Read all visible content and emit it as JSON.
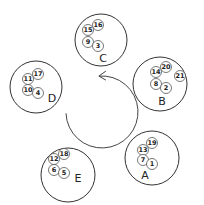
{
  "diagram": {
    "arrow": {
      "cx": 102,
      "cy": 112,
      "r": 36,
      "direction": "counterclockwise"
    },
    "groups": [
      {
        "label": "C",
        "cx": 101,
        "cy": 40,
        "r": 26,
        "lx": 103,
        "ly": 58,
        "items": [
          {
            "n": "16",
            "x": 98,
            "y": 25
          },
          {
            "n": "15",
            "x": 88,
            "y": 30
          },
          {
            "n": "9",
            "x": 88,
            "y": 42
          },
          {
            "n": "3",
            "x": 98,
            "y": 46
          }
        ]
      },
      {
        "label": "B",
        "cx": 160,
        "cy": 84,
        "r": 27,
        "lx": 162,
        "ly": 101,
        "items": [
          {
            "n": "20",
            "x": 166,
            "y": 67
          },
          {
            "n": "14",
            "x": 156,
            "y": 72
          },
          {
            "n": "21",
            "x": 180,
            "y": 76
          },
          {
            "n": "8",
            "x": 156,
            "y": 84
          },
          {
            "n": "2",
            "x": 166,
            "y": 88
          }
        ]
      },
      {
        "label": "D",
        "cx": 36,
        "cy": 87,
        "r": 26,
        "lx": 52,
        "ly": 98,
        "items": [
          {
            "n": "17",
            "x": 38,
            "y": 74
          },
          {
            "n": "11",
            "x": 28,
            "y": 79
          },
          {
            "n": "10",
            "x": 28,
            "y": 90
          },
          {
            "n": "4",
            "x": 38,
            "y": 93
          }
        ]
      },
      {
        "label": "E",
        "cx": 68,
        "cy": 175,
        "r": 27,
        "lx": 78,
        "ly": 178,
        "items": [
          {
            "n": "18",
            "x": 64,
            "y": 154
          },
          {
            "n": "12",
            "x": 54,
            "y": 159
          },
          {
            "n": "6",
            "x": 54,
            "y": 170
          },
          {
            "n": "5",
            "x": 64,
            "y": 173
          }
        ]
      },
      {
        "label": "A",
        "cx": 152,
        "cy": 158,
        "r": 27,
        "lx": 145,
        "ly": 175,
        "items": [
          {
            "n": "19",
            "x": 152,
            "y": 143
          },
          {
            "n": "13",
            "x": 143,
            "y": 150
          },
          {
            "n": "7",
            "x": 143,
            "y": 160
          },
          {
            "n": "1",
            "x": 152,
            "y": 164
          }
        ]
      }
    ]
  }
}
